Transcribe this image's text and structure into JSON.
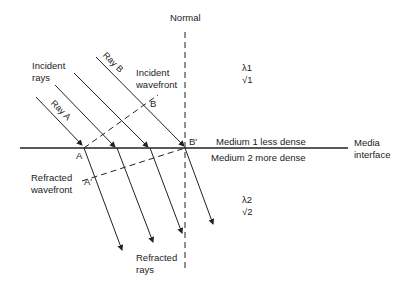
{
  "diagram": {
    "labels": {
      "normal": "Normal",
      "incident_rays_1": "Incident",
      "incident_rays_2": "rays",
      "ray_a": "Ray A",
      "ray_b": "Ray B",
      "incident_wavefront_1": "Incident",
      "incident_wavefront_2": "wavefront",
      "point_b": "B",
      "point_b_prime": "B'",
      "point_a": "A",
      "point_a_prime": "A'",
      "medium_1": "Medium 1 less dense",
      "medium_2": "Medium 2 more dense",
      "media_interface_1": "Media",
      "media_interface_2": "interface",
      "refracted_wavefront_1": "Refracted",
      "refracted_wavefront_2": "wavefront",
      "refracted_rays_1": "Refracted",
      "refracted_rays_2": "rays",
      "lambda1": "λ1",
      "v1": "√1",
      "lambda2": "λ2",
      "v2": "√2"
    },
    "colors": {
      "line": "#222222",
      "background": "#ffffff"
    }
  }
}
